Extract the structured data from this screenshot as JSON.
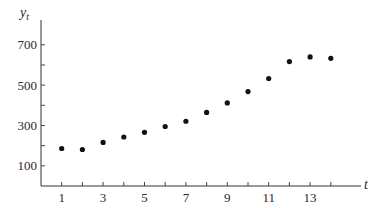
{
  "chart_data": {
    "type": "scatter",
    "title": "",
    "xlabel": "t",
    "ylabel": "y_t",
    "ylabel_main": "y",
    "ylabel_sub": "t",
    "x": [
      1,
      2,
      3,
      4,
      5,
      6,
      7,
      8,
      9,
      10,
      11,
      12,
      13,
      14
    ],
    "values": [
      186,
      181,
      216,
      243,
      266,
      295,
      321,
      365,
      412,
      468,
      533,
      617,
      640,
      633
    ],
    "x_ticks_major": [
      1,
      3,
      5,
      7,
      9,
      11,
      13
    ],
    "x_ticks_minor": [
      2,
      4,
      6,
      8,
      10,
      12,
      14
    ],
    "y_ticks_major": [
      100,
      300,
      500,
      700
    ],
    "y_ticks_minor": [
      200,
      400,
      600
    ],
    "xlim": [
      0,
      15
    ],
    "ylim": [
      0,
      800
    ],
    "grid": false,
    "legend": null
  },
  "layout": {
    "origin_x": 41,
    "origin_y": 186,
    "px_per_x": 20.7,
    "px_per_y": 0.2017,
    "x_axis_end": 361,
    "y_axis_top": 20,
    "point_color": "#111111"
  }
}
